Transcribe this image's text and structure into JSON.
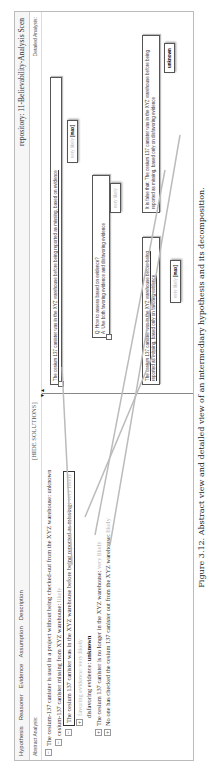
{
  "window": {
    "menu": [
      "Hypothesis",
      "Reasoner",
      "Evidence",
      "Assumption",
      "Description"
    ],
    "repository_title": "repository: 11-Believability-Analysis Scen",
    "left_header": "Abstract Analysis:",
    "right_header": "Detailed Analysis:",
    "hide_solutions": "[HIDE SOLUTIONS]"
  },
  "abstract_tree": [
    {
      "id": "r0",
      "text": "The cesium-137 canister is used in a project without being checked-out from the XYZ warehouse:",
      "value": "unknown"
    },
    {
      "id": "r1",
      "text": "cesium-137 canister missing from XYZ warehouse:",
      "value": "likely"
    },
    {
      "id": "r2",
      "text": "The cesium 137 canister was in the XYZ warehouse before being reported as missing:",
      "value": "very likely"
    },
    {
      "id": "r3",
      "text": "favoring evidence:",
      "value": "very likely"
    },
    {
      "id": "r4",
      "text": "disfavoring evidence:",
      "value": "unknown"
    },
    {
      "id": "r5",
      "text": "The cesium 137 canister is no longer in the XYZ warehouse:",
      "value": "very likely"
    },
    {
      "id": "r6",
      "text": "No one has checked the cesium 137 canister out from the XYZ warehouse:",
      "value": "likely"
    }
  ],
  "detailed": {
    "top_node": "The cesium 137 canister was in the XYZ warehouse before being reported as missing, based on evidence",
    "top_badge": {
      "value": "very likely",
      "tag": "[max]"
    },
    "question": "Q: How to assess based on evidence?",
    "answer": "A: Use both favoring evidence and disfavoring evidence",
    "qa_badge": "very likely",
    "favor_node": "The cesium 137 canister was in the XYZ warehouse before being reported as missing, based only on favoring evidence",
    "favor_badge": {
      "value": "very likely",
      "tag": "[max]"
    },
    "false_node": "It is false that: The cesium 137 canister was in the XYZ warehouse before being reported as missing, based only on disfavoring evidence",
    "false_badge": "unknown"
  },
  "caption": "Figure 3.12.  Abstract view and detailed view of an intermediary hypothesis and its decomposition."
}
